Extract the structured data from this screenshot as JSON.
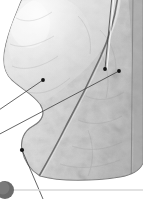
{
  "figure": {
    "kind": "anatomical-illustration",
    "style": "greyscale-halftone",
    "width": 143,
    "height": 199,
    "background_color": "#ffffff",
    "organ_fill_light": "#e9e9e9",
    "organ_fill_mid": "#d2d2d2",
    "organ_fill_dark": "#b4b4b4",
    "outline_color": "#6e6e6e",
    "fissure_color": "#5a5a5a",
    "leader_line_color": "#4a4a4a",
    "marker_dot_color": "#1a1a1a",
    "callout_line_color": "#c9c9c9"
  },
  "markers": [
    {
      "id": "marker-upper-lobe",
      "label": "",
      "x": 43,
      "y": 80
    },
    {
      "id": "marker-oblique-fissure",
      "label": "",
      "x": 105,
      "y": 69
    },
    {
      "id": "marker-lower-lobe",
      "label": "",
      "x": 119,
      "y": 71
    },
    {
      "id": "marker-inferior-border",
      "label": "",
      "x": 22,
      "y": 150
    }
  ],
  "leaders": [
    {
      "id": "leader-to-left-edge-upper",
      "from_x": 43,
      "from_y": 80,
      "to_x": -4,
      "to_y": 112
    },
    {
      "id": "leader-to-left-edge-lower",
      "from_x": 119,
      "from_y": 71,
      "to_x": -4,
      "to_y": 136
    },
    {
      "id": "leader-to-top-vertical",
      "from_x": 105,
      "from_y": 69,
      "to_x": 112,
      "to_y": -4
    },
    {
      "id": "leader-to-bottom",
      "from_x": 22,
      "from_y": 150,
      "to_x": 43,
      "to_y": 199
    }
  ],
  "badge": {
    "id": "figure-number-badge",
    "number": "",
    "center_x": 5,
    "center_y": 190,
    "radius": 9,
    "fill": "#6b6b6b",
    "rule_y": 190,
    "rule_color": "#d8d8d8"
  }
}
